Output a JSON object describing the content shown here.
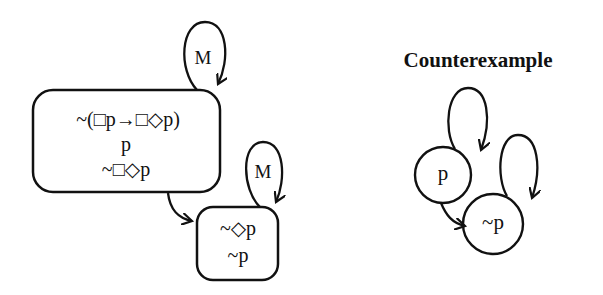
{
  "left_diagram": {
    "world1": {
      "label": "M",
      "formulas": [
        "~(□p→□◇p)",
        "p",
        "~□◇p"
      ]
    },
    "world2": {
      "label": "M",
      "formulas": [
        "~◇p",
        "~p"
      ]
    }
  },
  "right_diagram": {
    "title": "Counterexample",
    "nodes": [
      {
        "label": "p"
      },
      {
        "label": "~p"
      }
    ]
  },
  "colors": {
    "stroke": "#111111",
    "background": "#ffffff"
  }
}
